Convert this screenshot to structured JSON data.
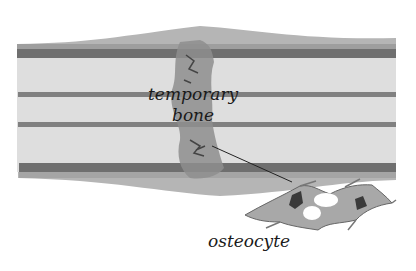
{
  "diagram": {
    "labels": {
      "temporary_bone_line1": "temporary",
      "temporary_bone_line2": "bone",
      "osteocyte": "osteocyte"
    },
    "colors": {
      "background": "#ffffff",
      "bone_matrix": "#dcdcdc",
      "band_dark": "#6f6f6f",
      "callus": "#9a9a9a",
      "callus_dark": "#555555",
      "cell_body": "#a8a8a8",
      "nucleus": "#3a3a3a",
      "text": "#1a1a1a"
    }
  }
}
